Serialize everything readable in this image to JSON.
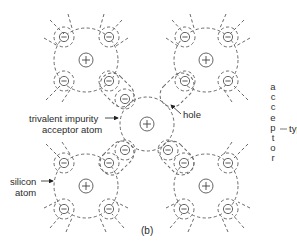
{
  "figure": {
    "caption": "(b)",
    "labels": {
      "impurity_line1": "trivalent impurity",
      "impurity_line2": "acceptor atom",
      "hole": "hole",
      "silicon_line1": "silicon",
      "silicon_line2": "atom",
      "type_word": "type",
      "vertical_word_letters": [
        "a",
        "c",
        "c",
        "e",
        "p",
        "t",
        "o",
        "r"
      ]
    },
    "atoms": [
      {
        "name": "silicon-top-left",
        "cx": 86,
        "cy": 60,
        "nucleus_sign": "+"
      },
      {
        "name": "silicon-top-right",
        "cx": 206,
        "cy": 60,
        "nucleus_sign": "+"
      },
      {
        "name": "acceptor-center",
        "cx": 147,
        "cy": 124,
        "nucleus_sign": "+"
      },
      {
        "name": "silicon-bottom-left",
        "cx": 86,
        "cy": 186,
        "nucleus_sign": "+"
      },
      {
        "name": "silicon-bottom-right",
        "cx": 206,
        "cy": 186,
        "nucleus_sign": "+"
      }
    ],
    "electron_sign": "−",
    "colors": {
      "line": "#6a6a6a",
      "text": "#2a2a2a",
      "background": "#ffffff"
    }
  }
}
